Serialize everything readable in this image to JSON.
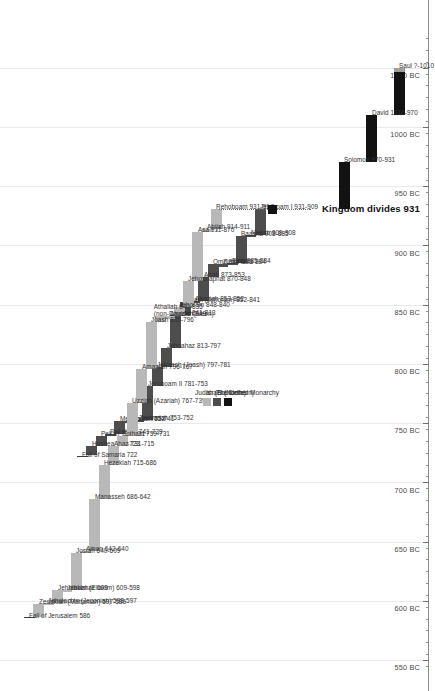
{
  "chart_data": {
    "type": "bar",
    "title": "",
    "xlabel": "",
    "ylabel": "",
    "orientation": "horizontal-timeline-rotated",
    "axis": {
      "units": "BC",
      "domain_start_bc": 1075,
      "domain_end_bc": 545,
      "major_step": 50,
      "minor_step": 10,
      "grid": true,
      "tick_labels": [
        "1050 BC",
        "1000 BC",
        "950 BC",
        "900 BC",
        "850 BC",
        "800 BC",
        "750 BC",
        "700 BC",
        "650 BC",
        "600 BC",
        "550 BC"
      ],
      "tick_values_bc": [
        1050,
        1000,
        950,
        900,
        850,
        800,
        750,
        700,
        650,
        600,
        550
      ]
    },
    "legend": {
      "position": "lower-left",
      "entries": [
        {
          "label": "The United Monarchy",
          "color": "#121212",
          "key": "united"
        },
        {
          "label": "Israel (Northern)",
          "color": "#4d4d4d",
          "key": "israel"
        },
        {
          "label": "Judah (Southern)",
          "color": "#b8b8b8",
          "key": "judah"
        }
      ]
    },
    "annotations": [
      {
        "label": "Kingdom divides 931",
        "year_bc": 931,
        "style": "bold"
      },
      {
        "label": "Fall of Samaria 722",
        "year_bc": 722,
        "style": "plain"
      },
      {
        "label": "Fall of Jerusalem 586",
        "year_bc": 586,
        "style": "plain"
      }
    ],
    "series": [
      {
        "name": "The United Monarchy",
        "key": "united",
        "color": "#121212",
        "values": [
          {
            "label": "Saul ?-1010",
            "name": "Saul",
            "start_bc": 1050,
            "end_bc": 1010,
            "uncertain_start": true,
            "lane": 0
          },
          {
            "label": "David 1010-970",
            "name": "David",
            "start_bc": 1010,
            "end_bc": 970,
            "lane": 1
          },
          {
            "label": "Solomon 970-931",
            "name": "Solomon",
            "start_bc": 970,
            "end_bc": 931,
            "lane": 2
          }
        ]
      },
      {
        "name": "Israel (Northern)",
        "key": "israel",
        "color": "#4d4d4d",
        "values": [
          {
            "label": "Jeroboam I 931-909",
            "name": "Jeroboam I",
            "start_bc": 931,
            "end_bc": 909,
            "lane": 4
          },
          {
            "label": "Nadab 909-908",
            "name": "Nadab",
            "start_bc": 909,
            "end_bc": 908,
            "lane": 5
          },
          {
            "label": "Baasha 908-885",
            "name": "Baasha",
            "start_bc": 908,
            "end_bc": 885,
            "lane": 6
          },
          {
            "label": "Elah 885-884",
            "name": "Elah",
            "start_bc": 885,
            "end_bc": 884,
            "lane": 7
          },
          {
            "label": "Zimri/Tibni 884",
            "name": "Zimri/Tibni",
            "start_bc": 884,
            "end_bc": 884,
            "lane": 8
          },
          {
            "label": "Omri 884-873",
            "name": "Omri",
            "start_bc": 884,
            "end_bc": 873,
            "lane": 9
          },
          {
            "label": "Ahab 873-853",
            "name": "Ahab",
            "start_bc": 873,
            "end_bc": 853,
            "lane": 10
          },
          {
            "label": "Ahaziah 853-852",
            "name": "Ahaziah",
            "start_bc": 853,
            "end_bc": 852,
            "lane": 11
          },
          {
            "label": "Joram (Jehoram) 852-841",
            "name": "Joram (Jehoram)",
            "start_bc": 852,
            "end_bc": 841,
            "lane": 12
          },
          {
            "label": "Jehu 841-813",
            "name": "Jehu",
            "start_bc": 841,
            "end_bc": 813,
            "lane": 13
          },
          {
            "label": "Jehoahaz 813-797",
            "name": "Jehoahaz",
            "start_bc": 813,
            "end_bc": 797,
            "lane": 14
          },
          {
            "label": "Jehoash (Joash) 797-781",
            "name": "Jehoash (Joash)",
            "start_bc": 797,
            "end_bc": 781,
            "lane": 15
          },
          {
            "label": "Jeroboam II 781-753",
            "name": "Jeroboam II",
            "start_bc": 781,
            "end_bc": 753,
            "lane": 16
          },
          {
            "label": "Zechariah 753-752",
            "name": "Zechariah",
            "start_bc": 753,
            "end_bc": 752,
            "lane": 17
          },
          {
            "label": "Shallum 752",
            "name": "Shallum",
            "start_bc": 752,
            "end_bc": 752,
            "lane": 18
          },
          {
            "label": "Menahem 752-741",
            "name": "Menahem",
            "start_bc": 752,
            "end_bc": 741,
            "lane": 19
          },
          {
            "label": "Pekahiah 741-739",
            "name": "Pekahiah",
            "start_bc": 741,
            "end_bc": 739,
            "lane": 20
          },
          {
            "label": "Pekah 739-731",
            "name": "Pekah",
            "start_bc": 739,
            "end_bc": 731,
            "lane": 21
          },
          {
            "label": "Hoshea 731-723",
            "name": "Hoshea",
            "start_bc": 731,
            "end_bc": 723,
            "lane": 22
          }
        ]
      },
      {
        "name": "Judah (Southern)",
        "key": "judah",
        "color": "#b8b8b8",
        "values": [
          {
            "label": "Rehoboam 931-914",
            "name": "Rehoboam",
            "start_bc": 931,
            "end_bc": 914,
            "lane": 0
          },
          {
            "label": "Abijah 914-911",
            "name": "Abijah",
            "start_bc": 914,
            "end_bc": 911,
            "lane": 1
          },
          {
            "label": "Asa 911-870",
            "name": "Asa",
            "start_bc": 911,
            "end_bc": 870,
            "lane": 2
          },
          {
            "label": "Jehoshaphat 870-848",
            "name": "Jehoshaphat",
            "start_bc": 870,
            "end_bc": 848,
            "lane": 3
          },
          {
            "label": "Jehoram 848-840",
            "name": "Jehoram",
            "start_bc": 848,
            "end_bc": 840,
            "lane": 4
          },
          {
            "label": "Ahaziah 840",
            "name": "Ahaziah",
            "start_bc": 840,
            "end_bc": 840,
            "lane": 5
          },
          {
            "label": "Athaliah 840-835 (non-Davidic Queen)",
            "name": "Athaliah",
            "start_bc": 840,
            "end_bc": 835,
            "lane": 6,
            "lines": [
              "Athaliah 840-835",
              "(non-Davidic Queen)"
            ]
          },
          {
            "label": "Joash 835-796",
            "name": "Joash",
            "start_bc": 835,
            "end_bc": 796,
            "lane": 7
          },
          {
            "label": "Amaziah 796-767",
            "name": "Amaziah",
            "start_bc": 796,
            "end_bc": 767,
            "lane": 8
          },
          {
            "label": "Uzziah (Azariah) 767-739",
            "name": "Uzziah (Azariah)",
            "start_bc": 767,
            "end_bc": 739,
            "lane": 9
          },
          {
            "label": "Jotham 739-731",
            "name": "Jotham",
            "start_bc": 739,
            "end_bc": 731,
            "lane": 10
          },
          {
            "label": "Ahaz 731-715",
            "name": "Ahaz",
            "start_bc": 731,
            "end_bc": 715,
            "lane": 11
          },
          {
            "label": "Hezekiah 715-686",
            "name": "Hezekiah",
            "start_bc": 715,
            "end_bc": 686,
            "lane": 12
          },
          {
            "label": "Manasseh 686-642",
            "name": "Manasseh",
            "start_bc": 686,
            "end_bc": 642,
            "lane": 13
          },
          {
            "label": "Amon 642-640",
            "name": "Amon",
            "start_bc": 642,
            "end_bc": 640,
            "lane": 14
          },
          {
            "label": "Josiah 640-609",
            "name": "Josiah",
            "start_bc": 640,
            "end_bc": 609,
            "lane": 15
          },
          {
            "label": "Jehoahaz 609",
            "name": "Jehoahaz",
            "start_bc": 609,
            "end_bc": 609,
            "lane": 16
          },
          {
            "label": "Jehoiakim (Eliakim) 609-598",
            "name": "Jehoiakim (Eliakim)",
            "start_bc": 609,
            "end_bc": 598,
            "lane": 17
          },
          {
            "label": "Jehoiachin (Jeconiah) 598-597",
            "name": "Jehoiachin (Jeconiah)",
            "start_bc": 598,
            "end_bc": 597,
            "lane": 18
          },
          {
            "label": "Zedekiah (Mattaniah) 597-586",
            "name": "Zedekiah (Mattaniah)",
            "start_bc": 597,
            "end_bc": 586,
            "lane": 19
          }
        ]
      }
    ]
  }
}
